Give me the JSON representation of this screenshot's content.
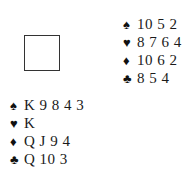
{
  "diagram": {
    "table": {
      "label": ""
    },
    "hands": {
      "north": {
        "spades": {
          "symbol": "♠",
          "cards": "10 5 2"
        },
        "hearts": {
          "symbol": "♥",
          "cards": "8 7 6 4"
        },
        "diamonds": {
          "symbol": "♦",
          "cards": "10 6 2"
        },
        "clubs": {
          "symbol": "♣",
          "cards": "8 5 4"
        }
      },
      "west": {
        "spades": {
          "symbol": "♠",
          "cards": "K 9 8 4 3"
        },
        "hearts": {
          "symbol": "♥",
          "cards": "K"
        },
        "diamonds": {
          "symbol": "♦",
          "cards": "Q J 9 4"
        },
        "clubs": {
          "symbol": "♣",
          "cards": "Q 10 3"
        }
      }
    }
  }
}
